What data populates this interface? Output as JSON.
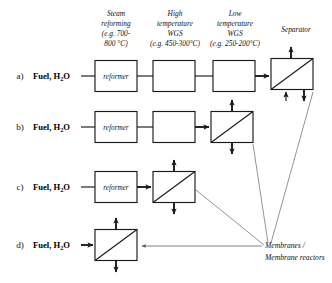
{
  "figure": {
    "background_color": "#ffffff",
    "line_color": "#1a1a1a",
    "leader_color": "#4a4a4a"
  },
  "column_headers": [
    {
      "id": "steam-reforming",
      "lines": [
        "Steam",
        "reforming",
        "(e.g. 700-",
        "800 °C)"
      ]
    },
    {
      "id": "high-temperature-wgs",
      "lines": [
        "High",
        "temperature",
        "WGS",
        "(e.g. 450-300°C)"
      ]
    },
    {
      "id": "low-temperature-wgs",
      "lines": [
        "Low",
        "temperature",
        "WGS",
        "(e.g. 250-200°C)"
      ]
    },
    {
      "id": "separator",
      "lines": [
        "Separator"
      ]
    }
  ],
  "rows": [
    {
      "letter": "a)",
      "feed_main": "Fuel, H",
      "feed_sub": "2",
      "feed_tail": "O",
      "reformer_label": "reformer",
      "blank_boxes": 2,
      "membrane_label": ""
    },
    {
      "letter": "b)",
      "feed_main": "Fuel, H",
      "feed_sub": "2",
      "feed_tail": "O",
      "reformer_label": "reformer",
      "blank_boxes": 1,
      "membrane_label": ""
    },
    {
      "letter": "c)",
      "feed_main": "Fuel, H",
      "feed_sub": "2",
      "feed_tail": "O",
      "reformer_label": "reformer",
      "blank_boxes": 0,
      "membrane_label": ""
    },
    {
      "letter": "d)",
      "feed_main": "Fuel, H",
      "feed_sub": "2",
      "feed_tail": "O",
      "reformer_label": "",
      "blank_boxes": 0,
      "membrane_label": ""
    }
  ],
  "annotation": {
    "line1": "Membranes /",
    "line2": "Membrane reactors"
  }
}
